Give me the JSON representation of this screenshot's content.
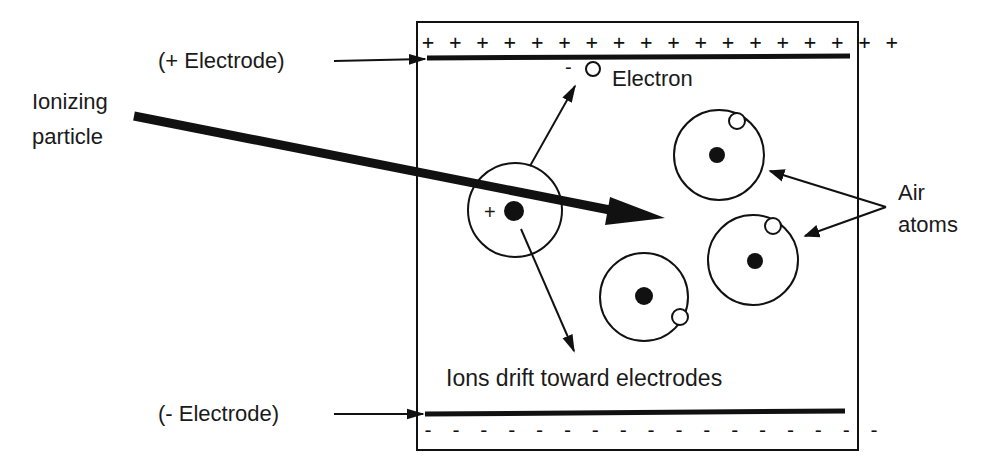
{
  "diagram": {
    "labels": {
      "positive_electrode": "(+ Electrode)",
      "negative_electrode": "(- Electrode)",
      "ionizing_particle_line1": "Ionizing",
      "ionizing_particle_line2": "particle",
      "electron": "Electron",
      "air_atoms_line1": "Air",
      "air_atoms_line2": "atoms",
      "ions_drift": "Ions drift toward electrodes",
      "ion_charge": "+",
      "electron_charge": "-"
    },
    "charges": {
      "top": "+ + + + + + + + + + + + + + + + + +",
      "bottom": "- - - - - - - - - - - - - - - - -"
    },
    "colors": {
      "ink": "#111111",
      "background": "#ffffff"
    }
  }
}
